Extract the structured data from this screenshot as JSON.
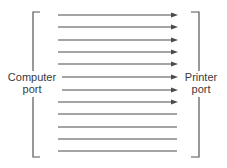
{
  "diagram": {
    "left_label": {
      "line1": "Computer",
      "line2": "port"
    },
    "right_label": {
      "line1": "Printer",
      "line2": "port"
    },
    "line_color": "#4a4a4a",
    "lines": [
      {
        "y": 15,
        "arrow": true
      },
      {
        "y": 27,
        "arrow": true
      },
      {
        "y": 40,
        "arrow": true
      },
      {
        "y": 52,
        "arrow": true
      },
      {
        "y": 64,
        "arrow": true
      },
      {
        "y": 77,
        "arrow": true
      },
      {
        "y": 90,
        "arrow": true
      },
      {
        "y": 102,
        "arrow": true
      },
      {
        "y": 114,
        "arrow": false
      },
      {
        "y": 127,
        "arrow": false
      },
      {
        "y": 139,
        "arrow": false
      },
      {
        "y": 151,
        "arrow": false
      }
    ]
  }
}
